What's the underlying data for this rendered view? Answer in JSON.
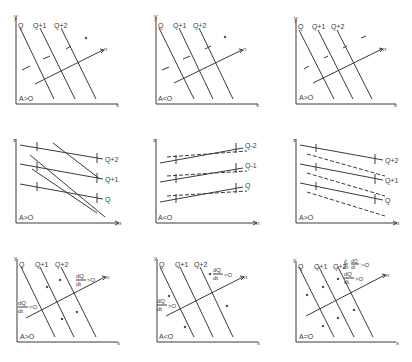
{
  "figure": {
    "rows": [
      {
        "type": "xy-isoquant",
        "panels": [
          {
            "id": "r1c1",
            "yaxis": "y",
            "xaxis": "x",
            "curves": [
              "Q",
              "Q+1",
              "Q+2"
            ],
            "vector": "n",
            "condition": "A>O"
          },
          {
            "id": "r1c2",
            "yaxis": "y",
            "xaxis": "x",
            "curves": [
              "Q",
              "Q+1",
              "Q+2"
            ],
            "vector": "n",
            "condition": "A<O"
          },
          {
            "id": "r1c3",
            "yaxis": "y",
            "xaxis": "x",
            "curves": [
              "Q",
              "Q+1",
              "Q+2"
            ],
            "vector": "n",
            "condition": "A>O"
          }
        ]
      },
      {
        "type": "zn-profiles",
        "panels": [
          {
            "id": "r2c1",
            "yaxis": "z",
            "xaxis": "n",
            "curves": [
              "Q",
              "Q+1",
              "Q+2"
            ],
            "condition": "A>O"
          },
          {
            "id": "r2c2",
            "yaxis": "z",
            "xaxis": "n",
            "curves": [
              "Q",
              "Q-1",
              "Q-2"
            ],
            "condition": "A<O"
          },
          {
            "id": "r2c3",
            "yaxis": "z",
            "xaxis": "n",
            "curves": [
              "Q",
              "Q+1",
              "Q+2"
            ],
            "condition": "A>O"
          }
        ]
      },
      {
        "type": "xy-tendency",
        "panels": [
          {
            "id": "r3c1",
            "yaxis": "y",
            "xaxis": "x",
            "curves": [
              "Q",
              "Q+1",
              "Q+2"
            ],
            "vector": "n",
            "condition": "A>O",
            "annot_top": {
              "num": "dQ",
              "den": "dt",
              "rel": ">O"
            },
            "annot_left": {
              "num": "dQ",
              "den": "dt",
              "rel": "<O"
            }
          },
          {
            "id": "r3c2",
            "yaxis": "y",
            "xaxis": "x",
            "curves": [
              "Q",
              "Q+1",
              "Q+2"
            ],
            "vector": "n",
            "condition": "A<O",
            "annot_top": {
              "num": "dQ",
              "den": "dt",
              "rel": "<O"
            },
            "annot_left": {
              "num": "dQ",
              "den": "dt",
              "rel": ">O"
            }
          },
          {
            "id": "r3c3",
            "yaxis": "y",
            "xaxis": "x",
            "curves": [
              "Q",
              "Q+1",
              "Q+2"
            ],
            "vector": "n",
            "condition": "A=O",
            "annot_top": {
              "pre_num": "∂",
              "pre_den": "∂n",
              "num": "dQ",
              "den": "dt",
              "rel": ">O"
            },
            "annot_mid": {
              "num": "dQ",
              "den": "dt",
              "rel": ">O"
            }
          }
        ]
      }
    ]
  },
  "labels": {
    "r1c1": {
      "y": "y",
      "x": "x",
      "q0": "Q",
      "q1": "Q+1",
      "q2": "Q+2",
      "n": "n",
      "cond": "A>O"
    },
    "r1c2": {
      "y": "y",
      "x": "x",
      "q0": "Q",
      "q1": "Q+1",
      "q2": "Q+2",
      "n": "n",
      "cond": "A<O"
    },
    "r1c3": {
      "y": "y",
      "x": "x",
      "q0": "Q",
      "q1": "Q+1",
      "q2": "Q+2",
      "n": "n",
      "cond": "A>O"
    },
    "r2c1": {
      "y": "z",
      "x": "n",
      "q0": "Q",
      "q1": "Q+1",
      "q2": "Q+2",
      "cond": "A>O"
    },
    "r2c2": {
      "y": "z",
      "x": "n",
      "q0": "Q",
      "q1": "Q-1",
      "q2": "Q-2",
      "cond": "A<O"
    },
    "r2c3": {
      "y": "z",
      "x": "n",
      "q0": "Q",
      "q1": "Q+1",
      "q2": "Q+2",
      "cond": "A>O"
    },
    "r3c1": {
      "y": "y",
      "x": "x",
      "q0": "Q",
      "q1": "Q+1",
      "q2": "Q+2",
      "n": "n",
      "cond": "A>O",
      "t_num": "dQ",
      "t_den": "dt",
      "t_rel": ">O",
      "l_num": "dQ",
      "l_den": "dt",
      "l_rel": "<O"
    },
    "r3c2": {
      "y": "y",
      "x": "x",
      "q0": "Q",
      "q1": "Q+1",
      "q2": "Q+2",
      "n": "n",
      "cond": "A<O",
      "t_num": "dQ",
      "t_den": "dt",
      "t_rel": "<O",
      "l_num": "dQ",
      "l_den": "dt",
      "l_rel": ">O"
    },
    "r3c3": {
      "y": "y",
      "x": "x",
      "q0": "Q",
      "q1": "Q+1",
      "q2": "Q+2",
      "n": "n",
      "cond": "A=O",
      "p_num": "∂",
      "p_den": "∂n",
      "t_num": "dQ",
      "t_den": "dt",
      "t_rel": ">O",
      "m_num": "dQ",
      "m_den": "dt",
      "m_rel": ">O"
    }
  },
  "colors": {
    "ink": "#3a3a3a",
    "background": "#ffffff"
  }
}
